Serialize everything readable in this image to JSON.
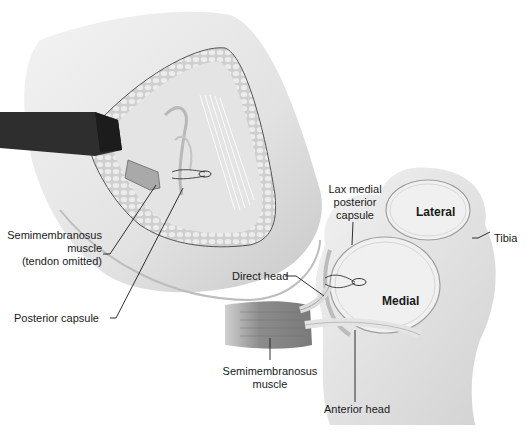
{
  "figure": {
    "left_view": {
      "labels": [
        {
          "id": "semimembranosus-tendon-omitted",
          "lines": [
            "Semimembranosus",
            "muscle",
            "(tendon omitted)"
          ]
        },
        {
          "id": "posterior-capsule",
          "lines": [
            "Posterior capsule"
          ]
        }
      ]
    },
    "right_view": {
      "labels": [
        {
          "id": "lax-medial-posterior-capsule",
          "lines": [
            "Lax medial",
            "posterior",
            "capsule"
          ]
        },
        {
          "id": "lateral",
          "lines": [
            "Lateral"
          ]
        },
        {
          "id": "tibia",
          "lines": [
            "Tibia"
          ]
        },
        {
          "id": "direct-head",
          "lines": [
            "Direct head"
          ]
        },
        {
          "id": "medial",
          "lines": [
            "Medial"
          ]
        },
        {
          "id": "semimembranosus-muscle",
          "lines": [
            "Semimembranosus",
            "muscle"
          ]
        },
        {
          "id": "anterior-head",
          "lines": [
            "Anterior head"
          ]
        }
      ]
    },
    "colors": {
      "skin": "#e6e6e6",
      "skin_shadow": "#c8c8c8",
      "fat": "#d9d9d9",
      "retractor": "#2e2e2e",
      "muscle": "#8a8a8a",
      "line": "#1a1a1a"
    }
  }
}
